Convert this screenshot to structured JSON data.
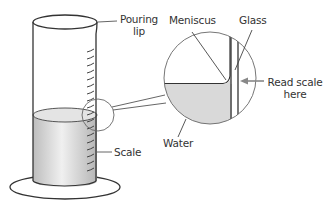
{
  "diagram": {
    "labels": {
      "pouring_lip_line1": "Pouring",
      "pouring_lip_line2": "lip",
      "meniscus": "Meniscus",
      "glass": "Glass",
      "read_scale_line1": "Read scale",
      "read_scale_line2": "here",
      "water": "Water",
      "scale": "Scale"
    },
    "colors": {
      "line": "#333333",
      "water": "#d9d9d9",
      "leader": "#555555",
      "arrow": "#888888"
    }
  }
}
